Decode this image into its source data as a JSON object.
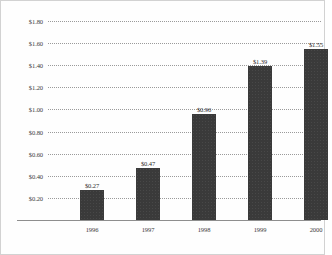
{
  "chart_data": {
    "type": "bar",
    "title": "",
    "subtitle": "",
    "xlabel": "",
    "ylabel": "",
    "categories": [
      "1996",
      "1997",
      "1998",
      "1999",
      "2000"
    ],
    "values": [
      0.27,
      0.47,
      0.96,
      1.39,
      1.55
    ],
    "value_labels": [
      "$0.27",
      "$0.47",
      "$0.96",
      "$1.39",
      "$1.55"
    ],
    "ylim": [
      0,
      1.8
    ],
    "ytick_values": [
      1.8,
      1.6,
      1.4,
      1.2,
      1.0,
      0.8,
      0.6,
      0.4,
      0.2
    ],
    "ytick_labels": [
      "$1.80",
      "$1.60",
      "$1.40",
      "$1.20",
      "$1.00",
      "$0.80",
      "$0.60",
      "$0.40",
      "$0.20"
    ],
    "grid": true,
    "grid_style": "dotted",
    "legend": false,
    "legend_position": "none",
    "bar_color": "#3a3a3a",
    "grid_color": "#9a9a9a",
    "axis_color": "#8e8e8e",
    "background_color": "#fefefe"
  }
}
